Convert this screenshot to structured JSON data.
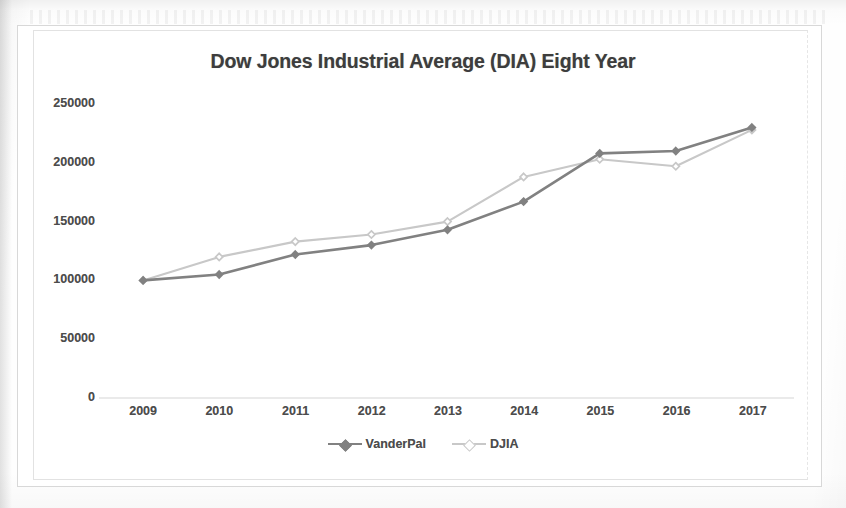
{
  "chart_data": {
    "type": "line",
    "title": "Dow Jones Industrial Average (DIA) Eight Year",
    "xlabel": "",
    "ylabel": "",
    "categories": [
      "2009",
      "2010",
      "2011",
      "2012",
      "2013",
      "2014",
      "2015",
      "2016",
      "2017"
    ],
    "series": [
      {
        "name": "VanderPal",
        "color": "#808080",
        "values": [
          100000,
          105000,
          122000,
          130000,
          143000,
          167000,
          208000,
          210000,
          230000
        ]
      },
      {
        "name": "DJIA",
        "color": "#c8c8c8",
        "values": [
          100000,
          120000,
          133000,
          139000,
          150000,
          188000,
          203000,
          197000,
          228000
        ]
      }
    ],
    "ylim": [
      0,
      250000
    ],
    "yticks": [
      0,
      50000,
      100000,
      150000,
      200000,
      250000
    ],
    "ytick_labels": [
      "0",
      "50000",
      "100000",
      "150000",
      "200000",
      "250000"
    ],
    "grid": false,
    "legend_position": "bottom",
    "marker": "diamond"
  }
}
